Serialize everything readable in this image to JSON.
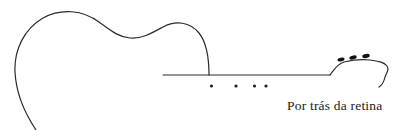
{
  "figure": {
    "caption": "Por trás da retina",
    "background_color": "#ffffff",
    "ink_color": "#2b2b2b",
    "caption_color": "#1a1a1a"
  },
  "drawing": {
    "subject": "acoustic-guitar",
    "style": "single-stroke-line-art",
    "stroke_width": 1.2,
    "parts": [
      {
        "name": "body-outline",
        "description": "upper bout, waist and lower bout curve, cropped at bottom-left edge"
      },
      {
        "name": "neck-line",
        "description": "horizontal line forming the neck, from body joint to headstock"
      },
      {
        "name": "fret-markers",
        "description": "four small dots below the neck line"
      },
      {
        "name": "headstock",
        "description": "flared head at right end of neck with curled tip"
      },
      {
        "name": "tuning-pegs",
        "description": "three small filled ovals on the headstock"
      }
    ],
    "fret_marker_dots": [
      {
        "cx": 211.5,
        "cy": 86.0,
        "r": 1.6
      },
      {
        "cx": 236.0,
        "cy": 86.0,
        "r": 1.6
      },
      {
        "cx": 254.5,
        "cy": 86.0,
        "r": 1.6
      },
      {
        "cx": 266.0,
        "cy": 86.0,
        "r": 1.6
      }
    ],
    "tuning_pegs": [
      {
        "cx": 341.0,
        "cy": 59.5,
        "rx": 3.6,
        "ry": 1.9,
        "rotate": -14
      },
      {
        "cx": 353.0,
        "cy": 57.5,
        "rx": 3.8,
        "ry": 1.9,
        "rotate": -16
      },
      {
        "cx": 366.0,
        "cy": 56.0,
        "rx": 3.8,
        "ry": 2.0,
        "rotate": -12
      }
    ],
    "paths": {
      "body": "M 36,130 C 24,112 16,92 15,72 C 14,50 24,29 43,18 C 61,8 83,10 99,22 C 110,30 118,37 130,38 C 142,39 152,33 163,27 C 176,20 190,22 199,33 C 207,43 209,57 209,75",
      "neck": "M 163,75 L 330,75",
      "headstock": "M 330,75 C 334,70 337,64 344,62 C 352,60 362,59 370,60 C 378,61 384,62 387,66 C 390,70 386,73 385,77 C 384,82 382,85 379,87"
    }
  }
}
